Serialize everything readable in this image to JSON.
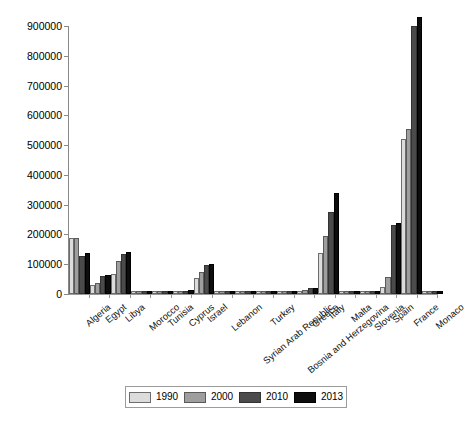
{
  "chart_data": {
    "type": "bar",
    "title": "",
    "subtitle": "",
    "xlabel": "",
    "ylabel": "",
    "ylim": [
      0,
      900000
    ],
    "ytick_values": [
      0,
      100000,
      200000,
      300000,
      400000,
      500000,
      600000,
      700000,
      800000,
      900000
    ],
    "ytick_labels": [
      "0",
      "100000",
      "200000",
      "300000",
      "400000",
      "500000",
      "600000",
      "700000",
      "800000",
      "900000"
    ],
    "grid": false,
    "legend_position": "bottom",
    "categories": [
      "Algeria",
      "Egypt",
      "Libya",
      "Morocco",
      "Tunisia",
      "Cyprus",
      "Israel",
      "Lebanon",
      "Syrian Arab Republic",
      "Turkey",
      "Bosnia and Herzegovina",
      "Greece",
      "Italy",
      "Malta",
      "Slovenia",
      "Spain",
      "France",
      "Monaco"
    ],
    "series": [
      {
        "name": "1990",
        "color": "#dcdcdc",
        "values": [
          182000,
          22000,
          59000,
          2500,
          900,
          1500,
          48000,
          300,
          800,
          2000,
          200,
          5000,
          132000,
          300,
          200,
          18000,
          513000,
          200
        ]
      },
      {
        "name": "2000",
        "color": "#9e9e9e",
        "values": [
          182000,
          29000,
          103000,
          3000,
          1800,
          2500,
          68000,
          400,
          1500,
          2500,
          300,
          8000,
          189000,
          400,
          300,
          51000,
          547000,
          300
        ]
      },
      {
        "name": "2010",
        "color": "#4b4b4b",
        "values": [
          120000,
          55000,
          128000,
          3500,
          2200,
          4500,
          92000,
          500,
          2500,
          3000,
          400,
          12000,
          268000,
          500,
          400,
          225000,
          893000,
          400
        ]
      },
      {
        "name": "2013",
        "color": "#0d0d0d",
        "values": [
          131000,
          58000,
          134000,
          3800,
          2500,
          5500,
          93000,
          600,
          2800,
          3200,
          500,
          13000,
          334000,
          600,
          500,
          232000,
          922000,
          500
        ]
      }
    ]
  },
  "legend": {
    "entries": [
      "1990",
      "2000",
      "2010",
      "2013"
    ]
  }
}
